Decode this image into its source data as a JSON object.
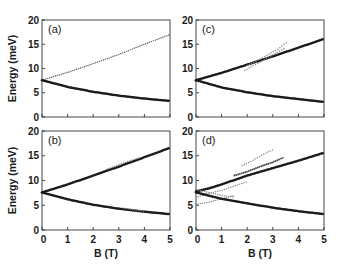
{
  "chart_data": [
    {
      "type": "scatter",
      "panel": "(a)",
      "xlabel": "",
      "ylabel": "Energy (meV)",
      "xlim": [
        0,
        5
      ],
      "ylim": [
        0,
        20
      ],
      "yticks": [
        0,
        5,
        10,
        15,
        20
      ],
      "xticks": [
        0,
        1,
        2,
        3,
        4,
        5
      ],
      "show_xtick_labels": false,
      "series": [
        {
          "name": "upper branch",
          "style": "light-dotted",
          "x": [
            0,
            1,
            2,
            3,
            4,
            5
          ],
          "y": [
            7.6,
            9.2,
            11.0,
            12.9,
            15.0,
            17.0
          ]
        },
        {
          "name": "lower branch",
          "style": "heavy",
          "x": [
            0,
            1,
            2,
            3,
            4,
            5
          ],
          "y": [
            7.6,
            6.2,
            5.2,
            4.4,
            3.8,
            3.3
          ]
        }
      ]
    },
    {
      "type": "scatter",
      "panel": "(b)",
      "xlabel": "B (T)",
      "ylabel": "Energy (meV)",
      "xlim": [
        0,
        5
      ],
      "ylim": [
        0,
        20
      ],
      "yticks": [
        0,
        5,
        10,
        15,
        20
      ],
      "xticks": [
        0,
        1,
        2,
        3,
        4,
        5
      ],
      "show_xtick_labels": true,
      "series": [
        {
          "name": "upper branch",
          "style": "heavy",
          "x": [
            0,
            1,
            2,
            3,
            4,
            5
          ],
          "y": [
            7.6,
            9.2,
            11.0,
            12.8,
            14.7,
            16.6
          ]
        },
        {
          "name": "upper satellite",
          "style": "light",
          "x": [
            2.5,
            3,
            3.5,
            3.8
          ],
          "y": [
            12.2,
            13.2,
            14.1,
            14.6
          ]
        },
        {
          "name": "lower branch",
          "style": "heavy",
          "x": [
            0,
            1,
            2,
            3,
            4,
            5
          ],
          "y": [
            7.6,
            6.2,
            5.1,
            4.3,
            3.7,
            3.2
          ]
        },
        {
          "name": "lower satellite",
          "style": "light",
          "x": [
            3.2,
            3.6,
            4.0
          ],
          "y": [
            4.4,
            4.1,
            3.8
          ]
        }
      ]
    },
    {
      "type": "scatter",
      "panel": "(c)",
      "xlabel": "",
      "ylabel": "",
      "xlim": [
        0,
        5
      ],
      "ylim": [
        0,
        20
      ],
      "yticks": [
        0,
        5,
        10,
        15,
        20
      ],
      "xticks": [
        0,
        1,
        2,
        3,
        4,
        5
      ],
      "show_xtick_labels": false,
      "series": [
        {
          "name": "upper branch",
          "style": "heavy",
          "x": [
            0,
            1,
            2,
            3,
            4,
            5
          ],
          "y": [
            7.6,
            9.1,
            10.8,
            12.5,
            14.3,
            16.1
          ]
        },
        {
          "name": "satellite 1",
          "style": "light",
          "x": [
            1.9,
            2.5,
            3.0,
            3.5
          ],
          "y": [
            9.6,
            11.3,
            12.8,
            14.3
          ]
        },
        {
          "name": "satellite 2",
          "style": "light",
          "x": [
            2.0,
            2.6,
            3.2,
            3.6
          ],
          "y": [
            10.6,
            12.2,
            14.0,
            15.6
          ]
        },
        {
          "name": "lower branch",
          "style": "heavy",
          "x": [
            0,
            1,
            2,
            3,
            4,
            5
          ],
          "y": [
            7.6,
            6.1,
            5.1,
            4.3,
            3.7,
            3.1
          ]
        }
      ]
    },
    {
      "type": "scatter",
      "panel": "(d)",
      "xlabel": "B (T)",
      "ylabel": "",
      "xlim": [
        0,
        5
      ],
      "ylim": [
        0,
        20
      ],
      "yticks": [
        0,
        5,
        10,
        15,
        20
      ],
      "xticks": [
        0,
        1,
        2,
        3,
        4,
        5
      ],
      "show_xtick_labels": true,
      "series": [
        {
          "name": "upper branch",
          "style": "heavy",
          "x": [
            0,
            0.5,
            1,
            1.5,
            2,
            3,
            4,
            5
          ],
          "y": [
            7.8,
            8.4,
            9.2,
            10.1,
            11.0,
            12.5,
            14.0,
            15.6
          ]
        },
        {
          "name": "satellite upper",
          "style": "medium",
          "x": [
            1.5,
            2,
            2.5,
            3,
            3.4
          ],
          "y": [
            11.0,
            11.8,
            12.8,
            13.7,
            14.6
          ]
        },
        {
          "name": "satellite faint",
          "style": "light",
          "x": [
            1.8,
            2.2,
            2.6,
            3.0
          ],
          "y": [
            13.0,
            14.0,
            15.2,
            16.2
          ]
        },
        {
          "name": "inner mixed 1",
          "style": "light",
          "x": [
            0,
            0.5,
            1,
            1.5,
            2
          ],
          "y": [
            6.6,
            7.4,
            8.0,
            8.9,
            9.8
          ]
        },
        {
          "name": "inner mixed 2",
          "style": "light",
          "x": [
            0,
            0.5,
            1,
            1.5
          ],
          "y": [
            5.2,
            5.6,
            6.3,
            7.0
          ]
        },
        {
          "name": "inner mixed 3",
          "style": "light",
          "x": [
            0,
            0.5,
            1,
            1.5
          ],
          "y": [
            8.2,
            7.6,
            7.0,
            6.6
          ]
        },
        {
          "name": "lower branch",
          "style": "heavy",
          "x": [
            0,
            1,
            2,
            3,
            4,
            5
          ],
          "y": [
            7.6,
            6.3,
            5.4,
            4.5,
            3.8,
            3.2
          ]
        }
      ]
    }
  ],
  "figure": {
    "ylabel": "Energy (meV)",
    "xlabel": "B (T)",
    "panel_labels": [
      "(a)",
      "(b)",
      "(c)",
      "(d)"
    ],
    "ytick_labels": [
      "0",
      "5",
      "10",
      "15",
      "20"
    ],
    "xtick_labels": [
      "0",
      "1",
      "2",
      "3",
      "4",
      "5"
    ]
  }
}
